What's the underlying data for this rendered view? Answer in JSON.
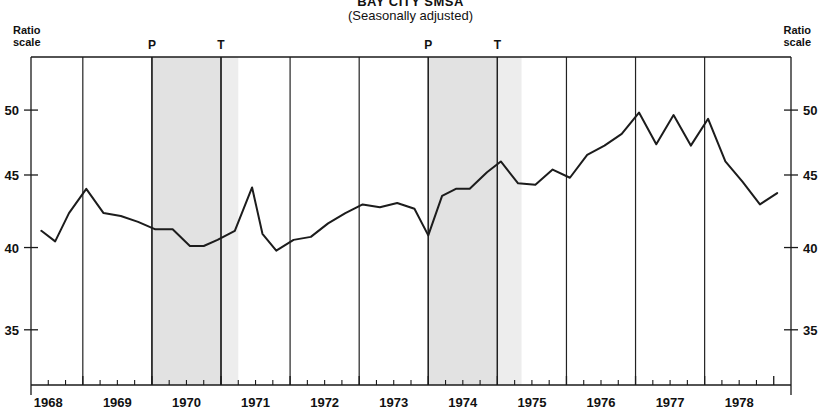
{
  "title": {
    "main": "BAY CITY SMSA",
    "sub": "(Seasonally adjusted)"
  },
  "axis_caption": {
    "left_line1": "Ratio",
    "left_line2": "scale",
    "right_line1": "Ratio",
    "right_line2": "scale"
  },
  "cycle_markers": [
    {
      "label": "P",
      "year": 1969.5
    },
    {
      "label": "T",
      "year": 1970.5
    },
    {
      "label": "P",
      "year": 1973.5
    },
    {
      "label": "T",
      "year": 1974.5
    }
  ],
  "chart_data": {
    "type": "line",
    "title": "BAY CITY SMSA",
    "subtitle": "(Seasonally adjusted)",
    "xlabel": "",
    "ylabel": "Ratio scale",
    "scale": "log",
    "grid": true,
    "legend": null,
    "xlim": [
      1967.75,
      1978.75
    ],
    "ylim": [
      32.0,
      54.5
    ],
    "ytick_labels": [
      "50",
      "45",
      "40",
      "35"
    ],
    "yticks": [
      50,
      45,
      40,
      35
    ],
    "xtick_labels": [
      "1968",
      "1969",
      "1970",
      "1971",
      "1972",
      "1973",
      "1974",
      "1975",
      "1976",
      "1977",
      "1978"
    ],
    "xticks": [
      1968,
      1969,
      1970,
      1971,
      1972,
      1973,
      1974,
      1975,
      1976,
      1977,
      1978
    ],
    "year_gridlines": [
      1968.5,
      1969.5,
      1970.5,
      1971.5,
      1972.5,
      1973.5,
      1974.5,
      1975.5,
      1976.5,
      1977.5
    ],
    "minor_ticks_per_year": 4,
    "shaded_bands": [
      {
        "name": "recession-1969-1970",
        "start": 1969.5,
        "end": 1970.5,
        "peak_label": "P",
        "trough_label": "T"
      },
      {
        "name": "recession-1973-1975",
        "start": 1973.5,
        "end": 1974.5,
        "peak_label": "P",
        "trough_label": "T"
      }
    ],
    "shaded_bands_extension": [
      {
        "name": "recession-1969-1970-tail",
        "start": 1970.5,
        "end": 1970.75
      },
      {
        "name": "recession-1973-1975-tail",
        "start": 1974.5,
        "end": 1974.85
      }
    ],
    "series": [
      {
        "name": "Bay City SMSA",
        "x": [
          1967.9,
          1968.1,
          1968.3,
          1968.55,
          1968.8,
          1969.05,
          1969.3,
          1969.55,
          1969.8,
          1970.05,
          1970.25,
          1970.45,
          1970.7,
          1970.95,
          1971.1,
          1971.3,
          1971.55,
          1971.8,
          1972.05,
          1972.3,
          1972.55,
          1972.8,
          1973.05,
          1973.3,
          1973.5,
          1973.7,
          1973.9,
          1974.1,
          1974.35,
          1974.55,
          1974.8,
          1975.05,
          1975.3,
          1975.55,
          1975.8,
          1976.05,
          1976.3,
          1976.55,
          1976.8,
          1977.05,
          1977.3,
          1977.55,
          1977.8,
          1978.05,
          1978.3,
          1978.55
        ],
        "y": [
          41.1,
          40.4,
          42.3,
          44.0,
          42.3,
          42.1,
          41.7,
          41.2,
          41.2,
          40.1,
          40.1,
          40.5,
          41.1,
          44.1,
          40.9,
          39.8,
          40.5,
          40.7,
          41.6,
          42.3,
          42.9,
          42.7,
          43.0,
          42.6,
          40.8,
          43.5,
          44.0,
          44.0,
          45.2,
          46.0,
          44.4,
          44.3,
          45.4,
          44.8,
          46.5,
          47.2,
          48.1,
          49.8,
          47.3,
          49.6,
          47.2,
          49.3,
          46.0,
          44.5,
          42.9,
          43.7
        ]
      }
    ]
  }
}
